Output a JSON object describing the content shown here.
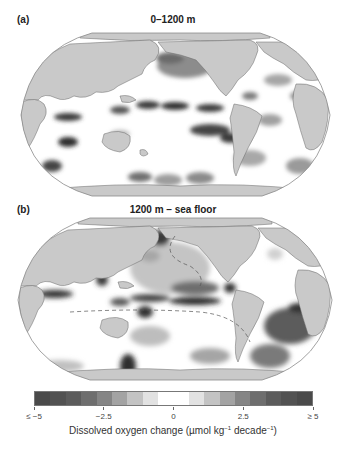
{
  "figure": {
    "panels": [
      {
        "label": "(a)",
        "title": "0–1200 m"
      },
      {
        "label": "(b)",
        "title": "1200 m – sea floor"
      }
    ],
    "colorbar": {
      "title_main": "Dissolved oxygen change (µmol kg",
      "title_exp1": "−1",
      "title_mid": " decade",
      "title_exp2": "−1",
      "title_end": ")",
      "ticks": [
        {
          "value": "≤ −5",
          "pos": 0.0
        },
        {
          "value": "−2.5",
          "pos": 0.25
        },
        {
          "value": "0",
          "pos": 0.5
        },
        {
          "value": "2.5",
          "pos": 0.75
        },
        {
          "value": "≥ 5",
          "pos": 1.0
        }
      ],
      "segments": [
        "#4a4a4a",
        "#525252",
        "#5c5c5c",
        "#6e6e6e",
        "#858585",
        "#a3a3a3",
        "#c3c3c3",
        "#e2e2e2",
        "#ffffff",
        "#ffffff",
        "#e2e2e2",
        "#c3c3c3",
        "#a3a3a3",
        "#858585",
        "#6e6e6e",
        "#5c5c5c",
        "#525252",
        "#4a4a4a"
      ]
    },
    "colors": {
      "land": "#c9c9c9",
      "ocean_zero": "#ffffff",
      "outline": "#8a8a8a",
      "coast": "#6b6b6b"
    }
  }
}
